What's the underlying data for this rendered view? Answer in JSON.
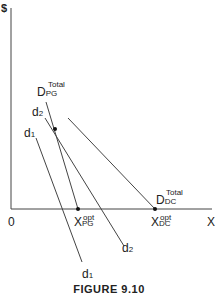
{
  "figure": {
    "caption": "FIGURE 9.10",
    "y_axis_label": "$",
    "x_axis_label": "X",
    "origin_label": "0",
    "curves": [
      {
        "id": "D_PG_total",
        "main": "D",
        "sub": "PG",
        "sup": "Total"
      },
      {
        "id": "D_DC_total",
        "main": "D",
        "sub": "DC",
        "sup": "Total"
      },
      {
        "id": "d2",
        "main": "d",
        "sub": "2"
      },
      {
        "id": "d1",
        "main": "d",
        "sub": "1"
      }
    ],
    "points": [
      {
        "id": "X_PG_opt",
        "main": "X",
        "sub": "PG",
        "sup": "opt"
      },
      {
        "id": "X_DC_opt",
        "main": "X",
        "sub": "DC",
        "sup": "opt"
      }
    ],
    "colors": {
      "line": "#333333",
      "background": "#ffffff"
    }
  }
}
